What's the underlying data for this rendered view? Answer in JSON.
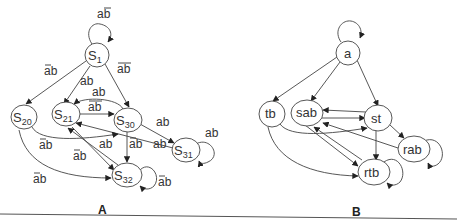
{
  "panels": [
    {
      "label": "A",
      "nodes": [
        {
          "id": "S1",
          "base": "S",
          "sub": "1"
        },
        {
          "id": "S20",
          "base": "S",
          "sub": "20"
        },
        {
          "id": "S21",
          "base": "S",
          "sub": "21"
        },
        {
          "id": "S30",
          "base": "S",
          "sub": "30"
        },
        {
          "id": "S31",
          "base": "S",
          "sub": "31"
        },
        {
          "id": "S32",
          "base": "S",
          "sub": "32"
        }
      ],
      "edge_labels": {
        "s1_self": "ab",
        "s1_s20": "ab",
        "s1_s21": "ab",
        "s1_s30": "ab",
        "s30_s21_curve": "ab",
        "s21_s30": "ab",
        "s30_s31": "ab",
        "s31_self": "ab",
        "s20_s30": "ab",
        "s21_s32": "ab",
        "s32_s21": "ab",
        "s30_s32": "ab",
        "s31_s21": "ab",
        "s20_s32": "ab",
        "s32_self": "ab"
      },
      "edge_label_negation": {
        "s1_self": "b",
        "s1_s20": "a",
        "s1_s30": "ab",
        "s21_s30": "ab",
        "s20_s30": "a",
        "s21_s32": "a",
        "s30_s32": "a",
        "s20_s32": "a",
        "s32_self": "a"
      }
    },
    {
      "label": "B",
      "nodes": [
        {
          "id": "a",
          "text": "a"
        },
        {
          "id": "tb",
          "text": "tb"
        },
        {
          "id": "sab",
          "text": "sab"
        },
        {
          "id": "st",
          "text": "st"
        },
        {
          "id": "rab",
          "text": "rab"
        },
        {
          "id": "rtb",
          "text": "rtb"
        }
      ]
    }
  ],
  "text": {
    "A": {
      "S1": "S",
      "S1_sub": "1",
      "S20": "S",
      "S20_sub": "20",
      "S21": "S",
      "S21_sub": "21",
      "S30": "S",
      "S30_sub": "30",
      "S31": "S",
      "S31_sub": "31",
      "S32": "S",
      "S32_sub": "32",
      "lbl_s1_self": "ab",
      "lbl_s1_s20": "ab",
      "lbl_s1_s21": "ab",
      "lbl_s1_s30": "ab",
      "lbl_s30_s21": "ab",
      "lbl_s21_s30": "ab",
      "lbl_s30_s31": "ab",
      "lbl_s31_self": "ab",
      "lbl_s20_s30": "ab",
      "lbl_s21_s32_a": "ab",
      "lbl_s32_s21": "ab",
      "lbl_s30_s32": "ab",
      "lbl_s31_s21": "ab",
      "lbl_s20_s32": "ab",
      "lbl_s32_self": "ab",
      "panel": "A"
    },
    "B": {
      "a": "a",
      "tb": "tb",
      "sab": "sab",
      "st": "st",
      "rab": "rab",
      "rtb": "rtb",
      "panel": "B"
    }
  }
}
